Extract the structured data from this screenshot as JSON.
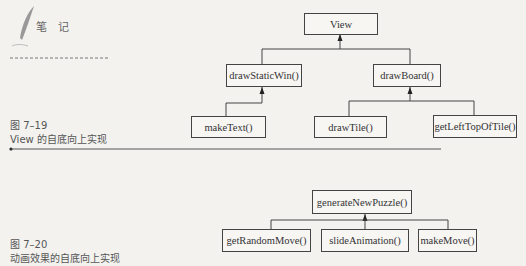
{
  "sidebar": {
    "note_label": "笔 记"
  },
  "figure_7_19": {
    "number": "图 7–19",
    "caption": "View 的自底向上实现",
    "nodes": {
      "root": "View",
      "draw_static_win": "drawStaticWin()",
      "draw_board": "drawBoard()",
      "make_text": "makeText()",
      "draw_tile": "drawTile()",
      "get_left_top_of_tile": "getLeftTopOfTile()"
    }
  },
  "figure_7_20": {
    "number": "图 7–20",
    "caption": "动画效果的自底向上实现",
    "nodes": {
      "root": "generateNewPuzzle()",
      "get_random_move": "getRandomMove()",
      "slide_animation": "slideAnimation()",
      "make_move": "makeMove()"
    }
  }
}
